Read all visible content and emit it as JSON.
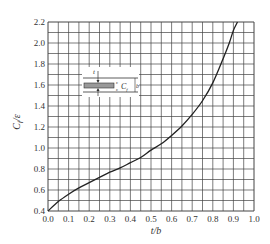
{
  "chart_data": {
    "type": "line",
    "title": "",
    "xlabel": "t/b",
    "ylabel": "C_f/ε",
    "xlim": [
      0.0,
      1.0
    ],
    "ylim": [
      0.4,
      2.2
    ],
    "grid": true,
    "x_ticks": [
      "0.0",
      "0.1",
      "0.2",
      "0.3",
      "0.4",
      "0.5",
      "0.6",
      "0.7",
      "0.8",
      "0.9",
      "1.0"
    ],
    "y_ticks": [
      "0.4",
      "0.6",
      "0.8",
      "1.0",
      "1.2",
      "1.4",
      "1.6",
      "1.8",
      "2.0",
      "2.2"
    ],
    "series": [
      {
        "name": "C_f/ε vs t/b",
        "x": [
          0.0,
          0.05,
          0.1,
          0.15,
          0.2,
          0.25,
          0.3,
          0.35,
          0.4,
          0.45,
          0.5,
          0.55,
          0.6,
          0.65,
          0.7,
          0.75,
          0.8,
          0.85,
          0.88,
          0.9,
          0.92
        ],
        "y": [
          0.4,
          0.49,
          0.56,
          0.62,
          0.67,
          0.72,
          0.77,
          0.81,
          0.86,
          0.91,
          0.98,
          1.04,
          1.12,
          1.21,
          1.32,
          1.45,
          1.62,
          1.85,
          2.0,
          2.12,
          2.22
        ]
      }
    ],
    "inset": {
      "description": "cross-section of plate of thickness t between two plates separated by b",
      "labels": [
        "t",
        "C_f",
        "b"
      ]
    }
  },
  "labels": {
    "xlabel": "t/b",
    "ylabel_main": "C",
    "ylabel_sub": "f",
    "ylabel_tail": "/ε",
    "inset_t": "t",
    "inset_cf_main": "C",
    "inset_cf_sub": "f",
    "inset_b": "b"
  }
}
